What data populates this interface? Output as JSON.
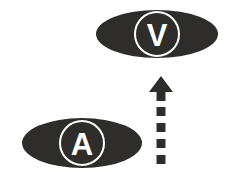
{
  "diagram": {
    "background_color": "#ffffff",
    "shape_color": "#2e2d2c",
    "label_color": "#ffffff",
    "nodes": [
      {
        "id": "visual",
        "label": "V",
        "icon_name": "eye-ellipse-shape",
        "position": "top-right",
        "ellipse": {
          "cx": 157,
          "cy": 34,
          "rx": 61,
          "ry": 24
        },
        "inner_circle": {
          "cx": 157,
          "cy": 34,
          "r": 22,
          "stroke": "#ffffff",
          "stroke_width": 2
        },
        "label_font_size": 31
      },
      {
        "id": "auditory",
        "label": "A",
        "icon_name": "ear-ellipse-shape",
        "position": "bottom-left",
        "ellipse": {
          "cx": 82,
          "cy": 143,
          "rx": 60,
          "ry": 25
        },
        "inner_circle": {
          "cx": 82,
          "cy": 143,
          "r": 22,
          "stroke": "#ffffff",
          "stroke_width": 2
        },
        "label_font_size": 31
      }
    ],
    "connector": {
      "id": "arrow-auditory-to-visual",
      "icon_name": "dashed-up-arrow-icon",
      "direction": "up",
      "style": "dashed-shaft-solid-head",
      "color": "#2e2d2c",
      "x_center": 161,
      "head": {
        "tip_y": 76,
        "base_y": 92,
        "half_width": 12,
        "shaft_width": 9,
        "shaft_bottom_y": 101
      },
      "dashes": [
        {
          "y": 107,
          "height": 9,
          "width": 9
        },
        {
          "y": 123,
          "height": 9,
          "width": 9
        },
        {
          "y": 139,
          "height": 9,
          "width": 9
        },
        {
          "y": 155,
          "height": 9,
          "width": 9
        }
      ]
    }
  }
}
